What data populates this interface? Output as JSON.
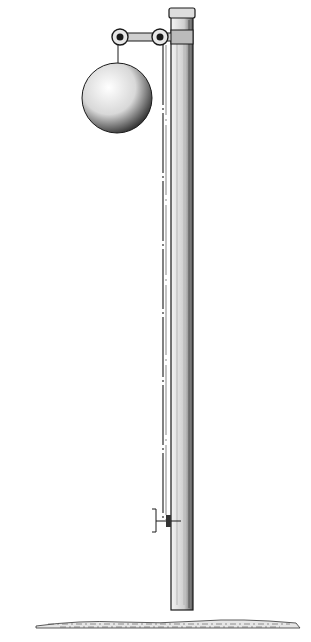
{
  "illustration": {
    "subject": "time-ball signal pole",
    "style": "black ink line drawing on white",
    "colors": {
      "background": "#ffffff",
      "ink": "#1a1a1a",
      "shade": "#555555"
    },
    "elements": [
      "pole",
      "cap",
      "crossarm",
      "pulley-left",
      "pulley-right",
      "ball",
      "cord",
      "cleat",
      "ground"
    ]
  }
}
